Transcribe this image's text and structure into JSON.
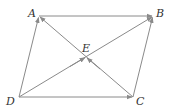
{
  "diagram": {
    "type": "parallelogram-vectors",
    "points": {
      "A": {
        "label": "A",
        "x": 39,
        "y": 16
      },
      "B": {
        "label": "B",
        "x": 153,
        "y": 16
      },
      "C": {
        "label": "C",
        "x": 133,
        "y": 97
      },
      "D": {
        "label": "D",
        "x": 19,
        "y": 97
      },
      "E": {
        "label": "E",
        "x": 86,
        "y": 57
      }
    },
    "vectors": [
      {
        "from": "A",
        "to": "B"
      },
      {
        "from": "D",
        "to": "A"
      },
      {
        "from": "D",
        "to": "C"
      },
      {
        "from": "C",
        "to": "B"
      },
      {
        "from": "C",
        "to": "A"
      },
      {
        "from": "D",
        "to": "B"
      },
      {
        "from": "D",
        "to": "E"
      },
      {
        "from": "C",
        "to": "E"
      }
    ],
    "colors": {
      "line": "#8a8a8a",
      "label": "#333333"
    }
  }
}
